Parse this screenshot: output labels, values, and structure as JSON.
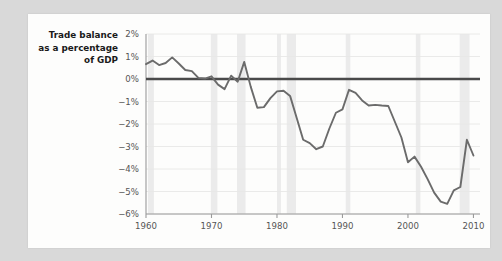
{
  "page": {
    "background_color": "#d9d9d9",
    "card_background_color": "#fdfdfc"
  },
  "chart_data": {
    "type": "line",
    "title_lines": [
      "Trade balance",
      "as a percentage",
      "of GDP"
    ],
    "xlabel": "",
    "ylabel": "Trade balance as a percentage of GDP",
    "xlim": [
      1960,
      2011
    ],
    "ylim": [
      -6,
      2
    ],
    "x_ticks": [
      1960,
      1970,
      1980,
      1990,
      2000,
      2010
    ],
    "x_tick_labels": [
      "1960",
      "1970",
      "1980",
      "1990",
      "2000",
      "2010"
    ],
    "y_ticks": [
      2,
      1,
      0,
      -1,
      -2,
      -3,
      -4,
      -5,
      -6
    ],
    "y_tick_labels": [
      "2%",
      "1%",
      "0%",
      "−1%",
      "−2%",
      "−3%",
      "−4%",
      "−5%",
      "−6%"
    ],
    "grid": true,
    "grid_color": "#e8e8e6",
    "legend": null,
    "zero_line": {
      "value": 0,
      "color": "#4a4a4a",
      "width": 2.4
    },
    "line_color": "#6b6b6b",
    "line_width": 1.9,
    "shaded_band_color": "#ebebeb",
    "shaded_bands": [
      {
        "start": 1960.3,
        "end": 1961.2
      },
      {
        "start": 1969.9,
        "end": 1970.9
      },
      {
        "start": 1973.9,
        "end": 1975.2
      },
      {
        "start": 1980.0,
        "end": 1980.6
      },
      {
        "start": 1981.5,
        "end": 1982.9
      },
      {
        "start": 1990.5,
        "end": 1991.2
      },
      {
        "start": 2001.2,
        "end": 2001.9
      },
      {
        "start": 2007.9,
        "end": 2009.4
      }
    ],
    "x": [
      1960,
      1961,
      1962,
      1963,
      1964,
      1965,
      1966,
      1967,
      1968,
      1969,
      1970,
      1971,
      1972,
      1973,
      1974,
      1975,
      1976,
      1977,
      1978,
      1979,
      1980,
      1981,
      1982,
      1983,
      1984,
      1985,
      1986,
      1987,
      1988,
      1989,
      1990,
      1991,
      1992,
      1993,
      1994,
      1995,
      1996,
      1997,
      1998,
      1999,
      2000,
      2001,
      2002,
      2003,
      2004,
      2005,
      2006,
      2007,
      2008,
      2009,
      2010
    ],
    "values": [
      0.66,
      0.82,
      0.62,
      0.71,
      0.96,
      0.69,
      0.4,
      0.35,
      0.05,
      0.02,
      0.12,
      -0.25,
      -0.45,
      0.15,
      -0.12,
      0.76,
      -0.35,
      -1.28,
      -1.25,
      -0.85,
      -0.55,
      -0.52,
      -0.75,
      -1.72,
      -2.7,
      -2.85,
      -3.12,
      -3.0,
      -2.2,
      -1.5,
      -1.35,
      -0.48,
      -0.62,
      -0.95,
      -1.18,
      -1.15,
      -1.18,
      -1.2,
      -1.9,
      -2.6,
      -3.7,
      -3.45,
      -3.9,
      -4.45,
      -5.05,
      -5.45,
      -5.55,
      -4.95,
      -4.8,
      -2.7,
      -3.4
    ]
  }
}
